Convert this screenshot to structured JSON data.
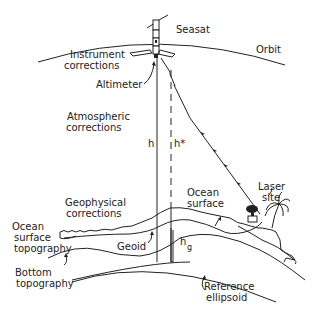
{
  "diagram": {
    "labels": {
      "seasat": "Seasat",
      "orbit": "Orbit",
      "instrument_corrections_1": "Instrument",
      "instrument_corrections_2": "corrections",
      "altimeter": "Altimeter",
      "atmospheric_corrections_1": "Atmospheric",
      "atmospheric_corrections_2": "corrections",
      "h": "h",
      "h_star": "h*",
      "geophysical_corrections_1": "Geophysical",
      "geophysical_corrections_2": "corrections",
      "ocean_surface_1": "Ocean",
      "ocean_surface_2": "surface",
      "laser_site_1": "Laser",
      "laser_site_2": "site",
      "ocean_surface_topography_1": "Ocean",
      "ocean_surface_topography_2": "surface",
      "ocean_surface_topography_3": "topography",
      "geoid": "Geoid",
      "hg": "h",
      "hg_sub": "g",
      "bottom_topography_1": "Bottom",
      "bottom_topography_2": "topography",
      "reference_ellipsoid_1": "Reference",
      "reference_ellipsoid_2": "ellipsoid"
    }
  }
}
